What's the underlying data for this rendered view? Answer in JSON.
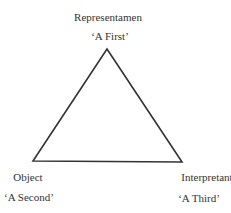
{
  "diagram": {
    "type": "semiotic-triangle",
    "nodes": [
      {
        "id": "representamen",
        "title": "Representamen",
        "subtitle": "‘A First’"
      },
      {
        "id": "object",
        "title": "Object",
        "subtitle": "‘A Second’"
      },
      {
        "id": "interpretant",
        "title": "Interpretant",
        "subtitle": "‘A Third’"
      }
    ],
    "line_color": "#333333"
  }
}
